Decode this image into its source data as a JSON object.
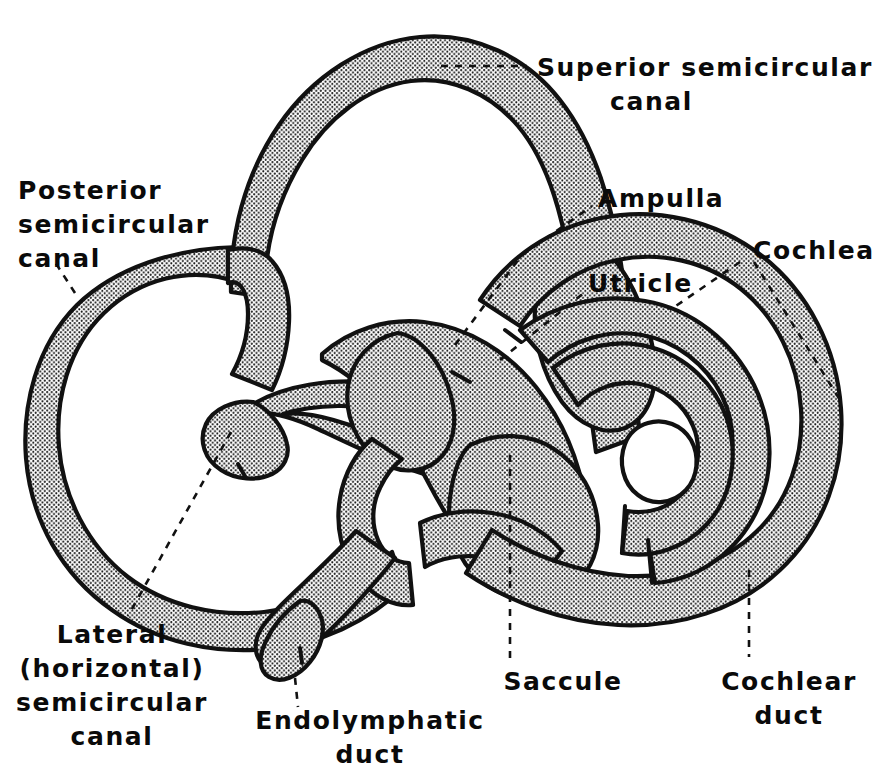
{
  "figure": {
    "background_color": "#ffffff",
    "ink_color": "#111111",
    "fill_style": "stippled halftone dot pattern"
  },
  "labels": {
    "superior_canal": {
      "id": "superior-semicircular-canal",
      "lines": [
        "Superior semicircular",
        "canal"
      ],
      "line1": "Superior semicircular",
      "line2": "canal",
      "align": "left"
    },
    "posterior_canal": {
      "id": "posterior-semicircular-canal",
      "lines": [
        "Posterior",
        "semicircular",
        "canal"
      ],
      "line1": "Posterior",
      "line2": "semicircular",
      "line3": "canal",
      "align": "left"
    },
    "ampulla": {
      "id": "ampulla",
      "lines": [
        "Ampulla"
      ],
      "line1": "Ampulla",
      "align": "left"
    },
    "utricle": {
      "id": "utricle",
      "lines": [
        "Utricle"
      ],
      "line1": "Utricle",
      "align": "left"
    },
    "cochlea": {
      "id": "cochlea",
      "lines": [
        "Cochlea"
      ],
      "line1": "Cochlea",
      "align": "left"
    },
    "lateral_canal": {
      "id": "lateral-horizontal-semicircular-canal",
      "lines": [
        "Lateral",
        "(horizontal)",
        "semicircular",
        "canal"
      ],
      "line1": "Lateral",
      "line2": "(horizontal)",
      "line3": "semicircular",
      "line4": "canal",
      "align": "center"
    },
    "endolymphatic_duct": {
      "id": "endolymphatic-duct",
      "lines": [
        "Endolymphatic",
        "duct"
      ],
      "line1": "Endolymphatic",
      "line2": "duct",
      "align": "center"
    },
    "saccule": {
      "id": "saccule",
      "lines": [
        "Saccule"
      ],
      "line1": "Saccule",
      "align": "center"
    },
    "cochlear_duct": {
      "id": "cochlear-duct",
      "lines": [
        "Cochlear",
        "duct"
      ],
      "line1": "Cochlear",
      "line2": "duct",
      "align": "center"
    }
  }
}
